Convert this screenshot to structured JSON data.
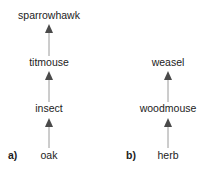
{
  "diagram": {
    "type": "food-chains",
    "chains": [
      {
        "label": "a)",
        "nodes": [
          "oak",
          "insect",
          "titmouse",
          "sparrowhawk"
        ],
        "edges": [
          [
            "oak",
            "insect"
          ],
          [
            "insect",
            "titmouse"
          ],
          [
            "titmouse",
            "sparrowhawk"
          ]
        ]
      },
      {
        "label": "b)",
        "nodes": [
          "herb",
          "woodmouse",
          "weasel"
        ],
        "edges": [
          [
            "herb",
            "woodmouse"
          ],
          [
            "woodmouse",
            "weasel"
          ]
        ]
      }
    ]
  },
  "chain_a": {
    "label": "a)",
    "n0": "oak",
    "n1": "insect",
    "n2": "titmouse",
    "n3": "sparrowhawk"
  },
  "chain_b": {
    "label": "b)",
    "n0": "herb",
    "n1": "woodmouse",
    "n2": "weasel"
  },
  "colors": {
    "arrow_line": "#9a9a9a",
    "arrow_head": "#4a4a4a",
    "text": "#222222"
  }
}
